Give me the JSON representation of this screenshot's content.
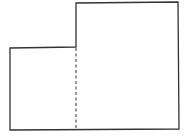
{
  "diagram": {
    "stroke_color": "#333333",
    "background": "#ffffff",
    "outline_points": "10,48 76,47 76,3 178,2 179,129 10,130",
    "divider": {
      "x1": 76,
      "y1": 48,
      "x2": 76,
      "y2": 128,
      "style": "dashed"
    }
  }
}
